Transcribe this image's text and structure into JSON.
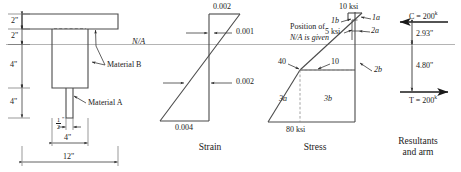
{
  "figure": {
    "line_color": "#3a3a3a",
    "na_color": "#9a9a9a",
    "text_color": "#1a1a1a"
  },
  "panels": {
    "section": {
      "caption": "",
      "dimensions": {
        "flange_depth": "2\"",
        "upper_web": "2\"",
        "mid_web": "4\"",
        "lower_stem": "4\"",
        "stem_width_num": "1",
        "stem_width_den": "2",
        "stem_width_unit": "\"",
        "web_width": "4\"",
        "total_width": "12\""
      },
      "annotations": {
        "neutral_axis": "N/A",
        "material_b": "Material B",
        "material_a": "Material A"
      }
    },
    "strain": {
      "caption": "Strain",
      "values": {
        "top": "0.002",
        "upper_inner": "0.001",
        "lower_inner": "0.002",
        "bottom": "0.004"
      }
    },
    "stress": {
      "caption": "Stress",
      "values": {
        "top_stress": "10 ksi",
        "mid_stress": "5 ksi",
        "label_1a": "1a",
        "label_1b": "1b",
        "label_2a": "2a",
        "label_2b": "2b",
        "label_3a": "3a",
        "label_3b": "3b",
        "upper_left": "40",
        "upper_right": "10",
        "bottom_stress": "80 ksi"
      },
      "note_line1": "Position of",
      "note_line2": "N/A is given"
    },
    "resultants": {
      "caption_line1": "Resultants",
      "caption_line2": "and arm",
      "compression_label": "C = 200",
      "compression_sup": "k",
      "tension_label": "T = 200",
      "tension_sup": "k",
      "arm_upper": "2.93\"",
      "arm_lower": "4.80\""
    }
  }
}
